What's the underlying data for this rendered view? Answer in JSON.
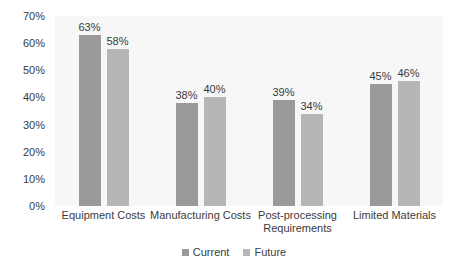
{
  "chart_data": {
    "type": "bar",
    "title": "",
    "subtitle": "",
    "xlabel": "",
    "ylabel": "",
    "ylim": [
      0,
      70
    ],
    "grid": false,
    "legend_position": "bottom",
    "y_ticks": [
      "0%",
      "10%",
      "20%",
      "30%",
      "40%",
      "50%",
      "60%",
      "70%"
    ],
    "y_tick_values": [
      0,
      10,
      20,
      30,
      40,
      50,
      60,
      70
    ],
    "categories": [
      "Equipment Costs",
      "Manufacturing Costs",
      "Post-processing Requirements",
      "Limited Materials"
    ],
    "category_lines": [
      [
        "Equipment Costs"
      ],
      [
        "Manufacturing Costs"
      ],
      [
        "Post-processing",
        "Requirements"
      ],
      [
        "Limited Materials"
      ]
    ],
    "series": [
      {
        "name": "Current",
        "color": "#9a9a9a",
        "values": [
          63,
          38,
          39,
          45
        ],
        "data_labels": [
          "63%",
          "38%",
          "39%",
          "45%"
        ]
      },
      {
        "name": "Future",
        "color": "#b6b6b6",
        "values": [
          58,
          40,
          34,
          46
        ],
        "data_labels": [
          "58%",
          "40%",
          "34%",
          "46%"
        ]
      }
    ]
  },
  "colors": {
    "plot_background": "#f7f7f7",
    "page_background": "#ffffff",
    "text": "#3b3b3b",
    "current": "#9a9a9a",
    "future": "#b6b6b6"
  }
}
